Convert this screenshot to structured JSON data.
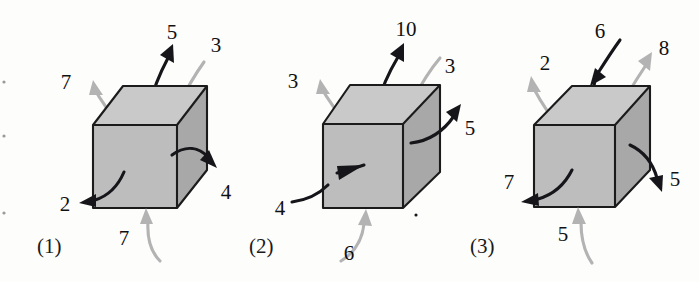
{
  "figure": {
    "background_color": "#fdfdfc",
    "cube_top_color": "#c9c9c9",
    "cube_front_color": "#bdbdbd",
    "cube_side_color": "#a8a8a8",
    "edge_color": "#1b1b1b",
    "dark_arrow_color": "#15151a",
    "light_arrow_color": "#b3b3b3"
  },
  "cubes": [
    {
      "caption": "(1)",
      "arrows": [
        {
          "id": "top-out-black",
          "label": "5",
          "color": "dark",
          "direction": "out",
          "face": "top"
        },
        {
          "id": "top-in-gray",
          "label": "3",
          "color": "light",
          "direction": "in",
          "face": "top"
        },
        {
          "id": "left-out-gray",
          "label": "7",
          "color": "light",
          "direction": "out",
          "face": "left"
        },
        {
          "id": "front-out-black",
          "label": "2",
          "color": "dark",
          "direction": "out",
          "face": "front"
        },
        {
          "id": "side-out-black",
          "label": "4",
          "color": "dark",
          "direction": "out",
          "face": "side"
        },
        {
          "id": "bottom-in-gray",
          "label": "7",
          "color": "light",
          "direction": "in",
          "face": "bottom"
        }
      ]
    },
    {
      "caption": "(2)",
      "arrows": [
        {
          "id": "top-out-black",
          "label": "10",
          "color": "dark",
          "direction": "out",
          "face": "top"
        },
        {
          "id": "top-in-gray",
          "label": "3",
          "color": "light",
          "direction": "in",
          "face": "top"
        },
        {
          "id": "left-out-gray",
          "label": "3",
          "color": "light",
          "direction": "out",
          "face": "left"
        },
        {
          "id": "front-in-black",
          "label": "4",
          "color": "dark",
          "direction": "in",
          "face": "front"
        },
        {
          "id": "side-out-black",
          "label": "5",
          "color": "dark",
          "direction": "out",
          "face": "side"
        },
        {
          "id": "bottom-in-gray",
          "label": "6",
          "color": "light",
          "direction": "in",
          "face": "bottom"
        }
      ]
    },
    {
      "caption": "(3)",
      "arrows": [
        {
          "id": "top-in-black",
          "label": "6",
          "color": "dark",
          "direction": "in",
          "face": "top"
        },
        {
          "id": "top-out-gray",
          "label": "8",
          "color": "light",
          "direction": "out",
          "face": "top"
        },
        {
          "id": "left-out-gray",
          "label": "2",
          "color": "light",
          "direction": "out",
          "face": "left"
        },
        {
          "id": "front-out-black",
          "label": "7",
          "color": "dark",
          "direction": "out",
          "face": "front"
        },
        {
          "id": "side-out-black",
          "label": "5",
          "color": "dark",
          "direction": "out",
          "face": "side"
        },
        {
          "id": "bottom-in-gray",
          "label": "5",
          "color": "light",
          "direction": "in",
          "face": "bottom"
        }
      ]
    }
  ]
}
